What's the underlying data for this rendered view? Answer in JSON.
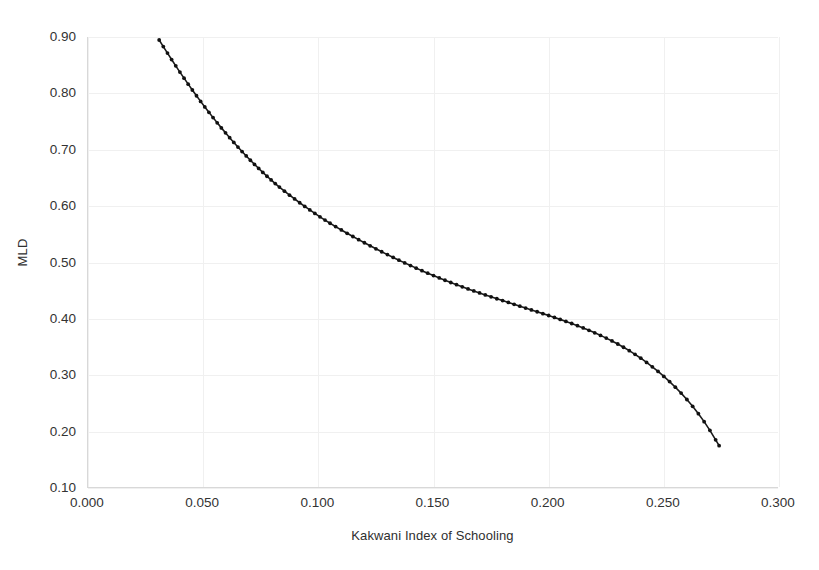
{
  "chart_data": {
    "type": "line",
    "title": "",
    "subtitle": "",
    "xlabel": "Kakwani Index of Schooling",
    "ylabel": "MLD",
    "xlim": [
      0.0,
      0.3
    ],
    "ylim": [
      0.1,
      0.9
    ],
    "xticks": [
      "0.000",
      "0.050",
      "0.100",
      "0.150",
      "0.200",
      "0.250",
      "0.300"
    ],
    "xtick_values": [
      0.0,
      0.05,
      0.1,
      0.15,
      0.2,
      0.25,
      0.3
    ],
    "yticks": [
      "0.10",
      "0.20",
      "0.30",
      "0.40",
      "0.50",
      "0.60",
      "0.70",
      "0.80",
      "0.90"
    ],
    "ytick_values": [
      0.1,
      0.2,
      0.3,
      0.4,
      0.5,
      0.6,
      0.7,
      0.8,
      0.9
    ],
    "grid": true,
    "legend": false,
    "legend_position": "none",
    "marker": "small filled circle",
    "line_color": "#1a1a1a",
    "marker_color": "#111111",
    "grid_color": "#f0f0f0",
    "axis_color": "#d8d8d8",
    "background_color": "#ffffff",
    "series": [
      {
        "name": "MLD vs Kakwani Index of Schooling",
        "x": [
          0.0309,
          0.0327,
          0.0345,
          0.0363,
          0.0381,
          0.0399,
          0.0417,
          0.0435,
          0.0453,
          0.0471,
          0.0489,
          0.0507,
          0.0525,
          0.0543,
          0.0561,
          0.0579,
          0.0597,
          0.0615,
          0.0633,
          0.0651,
          0.0669,
          0.0687,
          0.0705,
          0.0723,
          0.0741,
          0.0759,
          0.0777,
          0.0795,
          0.0813,
          0.0831,
          0.0853,
          0.0875,
          0.0897,
          0.0919,
          0.0941,
          0.0963,
          0.0985,
          0.1007,
          0.1029,
          0.1051,
          0.1075,
          0.11,
          0.1125,
          0.115,
          0.1175,
          0.12,
          0.1225,
          0.125,
          0.1275,
          0.13,
          0.1325,
          0.135,
          0.1375,
          0.14,
          0.1425,
          0.145,
          0.1475,
          0.15,
          0.1525,
          0.155,
          0.1575,
          0.16,
          0.1625,
          0.165,
          0.1675,
          0.17,
          0.1725,
          0.175,
          0.1775,
          0.18,
          0.1825,
          0.185,
          0.1875,
          0.19,
          0.1925,
          0.195,
          0.1975,
          0.2,
          0.2025,
          0.205,
          0.2075,
          0.21,
          0.2125,
          0.215,
          0.2175,
          0.22,
          0.2225,
          0.225,
          0.2275,
          0.23,
          0.2325,
          0.235,
          0.2375,
          0.24,
          0.2425,
          0.245,
          0.2475,
          0.25,
          0.2525,
          0.255,
          0.2575,
          0.26,
          0.2625,
          0.265,
          0.2675,
          0.27,
          0.2725,
          0.274
        ],
        "y": [
          0.8947,
          0.883,
          0.8714,
          0.86,
          0.8488,
          0.8378,
          0.827,
          0.8164,
          0.806,
          0.7958,
          0.7858,
          0.776,
          0.7664,
          0.757,
          0.7478,
          0.7388,
          0.73,
          0.7214,
          0.713,
          0.7048,
          0.6968,
          0.689,
          0.6814,
          0.674,
          0.6668,
          0.6598,
          0.653,
          0.6464,
          0.64,
          0.6338,
          0.6265,
          0.6195,
          0.6127,
          0.606,
          0.5995,
          0.5932,
          0.587,
          0.581,
          0.5752,
          0.5696,
          0.5637,
          0.5577,
          0.5518,
          0.5461,
          0.5405,
          0.535,
          0.5296,
          0.5243,
          0.5191,
          0.514,
          0.509,
          0.5041,
          0.4993,
          0.4946,
          0.49,
          0.4855,
          0.4811,
          0.4768,
          0.4726,
          0.4685,
          0.4645,
          0.4606,
          0.4568,
          0.4531,
          0.4495,
          0.446,
          0.4425,
          0.4391,
          0.4357,
          0.4324,
          0.4291,
          0.4258,
          0.4225,
          0.4192,
          0.4159,
          0.4126,
          0.4093,
          0.406,
          0.4026,
          0.3991,
          0.3955,
          0.3918,
          0.3879,
          0.3839,
          0.3797,
          0.3753,
          0.3707,
          0.3659,
          0.3608,
          0.3554,
          0.3497,
          0.3436,
          0.3371,
          0.3302,
          0.3228,
          0.315,
          0.3067,
          0.298,
          0.2887,
          0.2788,
          0.2683,
          0.257,
          0.2449,
          0.2318,
          0.2177,
          0.2023,
          0.1855,
          0.175
        ]
      }
    ]
  }
}
